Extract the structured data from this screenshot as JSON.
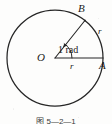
{
  "figure": {
    "type": "geometry-diagram",
    "background_color": "#fdfdfc",
    "stroke_color": "#262626",
    "caption": "图 5—2—1",
    "labels": {
      "center_point": "O",
      "point_on_horizontal_radius": "A",
      "point_on_angled_radius": "B",
      "radius_upper": "r",
      "radius_lower": "r",
      "angle_value": "1 rad"
    },
    "geometry": {
      "circle": {
        "cx": 55,
        "cy": 58,
        "r": 48
      },
      "radius_OA": {
        "x1": 55,
        "y1": 58,
        "x2": 103,
        "y2": 58
      },
      "radius_OB": {
        "x1": 55,
        "y1": 58,
        "x2": 84,
        "y2": 19
      },
      "angle_arc_radius": 17,
      "angle_degrees": 57.3,
      "arrow_on": "angle-arc"
    }
  }
}
